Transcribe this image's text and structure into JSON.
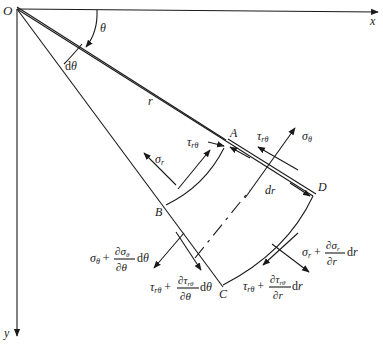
{
  "diagram": {
    "axes": {
      "origin": "O",
      "x": "x",
      "y": "y"
    },
    "angles": {
      "theta": "θ",
      "dtheta": "dθ"
    },
    "radius": "r",
    "dr": "dr",
    "points": {
      "A": "A",
      "B": "B",
      "C": "C",
      "D": "D"
    },
    "stresses": {
      "sigma_r": {
        "base": "σ",
        "sub": "r"
      },
      "tau_rtheta_inner": {
        "base": "τ",
        "sub": "rθ"
      },
      "tau_rtheta_AD": {
        "base": "τ",
        "sub": "rθ"
      },
      "sigma_theta": {
        "base": "σ",
        "sub": "θ"
      },
      "sigma_theta_plus": {
        "base": "σ",
        "sub": "θ",
        "plus": "+",
        "num": "∂σ",
        "num_sub": "θ",
        "den": "∂θ",
        "tail": "dθ"
      },
      "tau_rtheta_plus_theta": {
        "base": "τ",
        "sub": "rθ",
        "plus": "+",
        "num": "∂τ",
        "num_sub": "rθ",
        "den": "∂θ",
        "tail": "dθ"
      },
      "sigma_r_plus": {
        "base": "σ",
        "sub": "r",
        "plus": "+",
        "num": "∂σ",
        "num_sub": "r",
        "den": "∂r",
        "tail": "dr"
      },
      "tau_rtheta_plus_r": {
        "base": "τ",
        "sub": "rθ",
        "plus": "+",
        "num": "∂τ",
        "num_sub": "rθ",
        "den": "∂r",
        "tail": "dr"
      }
    }
  }
}
